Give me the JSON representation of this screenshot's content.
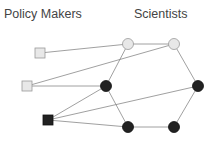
{
  "labels": {
    "left": "Policy Makers",
    "right": "Scientists"
  },
  "colors": {
    "light": "#e8e8e8",
    "dark": "#222222",
    "edge": "#888888"
  },
  "nodes": [
    {
      "id": "pm1",
      "shape": "square",
      "fill": "light",
      "x": 40,
      "y": 53
    },
    {
      "id": "pm2",
      "shape": "square",
      "fill": "light",
      "x": 27,
      "y": 86
    },
    {
      "id": "pm3",
      "shape": "square",
      "fill": "dark",
      "x": 48,
      "y": 120
    },
    {
      "id": "s1",
      "shape": "circle",
      "fill": "light",
      "x": 128,
      "y": 44
    },
    {
      "id": "s2",
      "shape": "circle",
      "fill": "light",
      "x": 174,
      "y": 44
    },
    {
      "id": "s3",
      "shape": "circle",
      "fill": "dark",
      "x": 106,
      "y": 86
    },
    {
      "id": "s4",
      "shape": "circle",
      "fill": "dark",
      "x": 198,
      "y": 86
    },
    {
      "id": "s5",
      "shape": "circle",
      "fill": "dark",
      "x": 128,
      "y": 127
    },
    {
      "id": "s6",
      "shape": "circle",
      "fill": "dark",
      "x": 174,
      "y": 127
    }
  ],
  "edges": [
    [
      "pm1",
      "s1"
    ],
    [
      "pm2",
      "s2"
    ],
    [
      "pm2",
      "s3"
    ],
    [
      "pm3",
      "s3"
    ],
    [
      "pm3",
      "s4"
    ],
    [
      "pm3",
      "s5"
    ],
    [
      "s1",
      "s2"
    ],
    [
      "s1",
      "s3"
    ],
    [
      "s2",
      "s4"
    ],
    [
      "s3",
      "s5"
    ],
    [
      "s5",
      "s6"
    ],
    [
      "s4",
      "s6"
    ]
  ]
}
